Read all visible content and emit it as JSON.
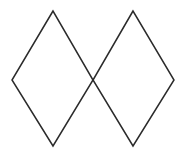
{
  "figure": {
    "name": "two-overlapping-rhombi",
    "background_color": "#ffffff",
    "stroke_color": "#2b2b2b",
    "stroke_width": 1.5,
    "fill": "none",
    "canvas": {
      "width": 183,
      "height": 161
    },
    "shapes": [
      {
        "name": "left-rhombus",
        "type": "rhombus",
        "points": "53,11 12,80 53,146 93,80",
        "vertices": {
          "top": [
            53,
            11
          ],
          "left": [
            12,
            80
          ],
          "bottom": [
            53,
            146
          ],
          "right": [
            93,
            80
          ]
        },
        "width": 81,
        "height": 135
      },
      {
        "name": "right-rhombus",
        "type": "rhombus",
        "points": "133,11 93,80 133,146 174,80",
        "vertices": {
          "top": [
            133,
            11
          ],
          "left": [
            93,
            80
          ],
          "bottom": [
            133,
            146
          ],
          "right": [
            174,
            80
          ]
        },
        "width": 81,
        "height": 135
      }
    ],
    "intersection_point": [
      93,
      80
    ]
  }
}
